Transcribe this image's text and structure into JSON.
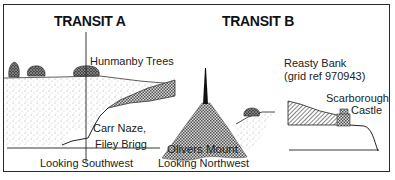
{
  "figure": {
    "panels": [
      {
        "id": "transit-a",
        "title": "TRANSIT A",
        "labels": {
          "upper": "Hunmanby Trees",
          "lower_line1": "Carr Naze,",
          "lower_line2": "Filey Brigg"
        },
        "direction": "Looking Southwest"
      },
      {
        "id": "transit-b",
        "title": "TRANSIT B",
        "labels": {
          "mount": "Olivers Mount",
          "bank_line1": "Reasty Bank",
          "bank_line2": "(grid ref 970943)",
          "castle_line1": "Scarborough",
          "castle_line2": "Castle"
        },
        "direction": "Looking Northwest"
      }
    ],
    "colors": {
      "ink": "#1a1a1a",
      "background": "#ffffff"
    }
  }
}
